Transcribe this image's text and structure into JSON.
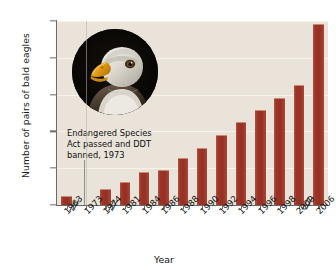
{
  "chart_data": {
    "type": "bar",
    "title": "",
    "xlabel": "Year",
    "ylabel": "Number of pairs of bald eagles",
    "categories": [
      "1963",
      "1973",
      "1974",
      "1981",
      "1984",
      "1986",
      "1988",
      "1990",
      "1992",
      "1994",
      "1996",
      "1998",
      "2000",
      "2006"
    ],
    "tick_labels": [
      "1963",
      "1973",
      "1974",
      "1981",
      "1984",
      "1986",
      "1988",
      "1990",
      "1992",
      "1994",
      "1996",
      "1998",
      "2000",
      "2006"
    ],
    "values": [
      417,
      null,
      791,
      1188,
      1757,
      1875,
      2475,
      3035,
      3749,
      4449,
      5094,
      5748,
      6471,
      9789
    ],
    "ylim": [
      0,
      10000
    ],
    "ytick_labels": [
      "0",
      "2000",
      "4000",
      "6000",
      "8000",
      "10,000"
    ],
    "ytick_values": [
      0,
      2000,
      4000,
      6000,
      8000,
      10000
    ],
    "grid": true,
    "legend": "none",
    "axis_breaks": [
      "after 1963",
      "after 1974",
      "after 2000"
    ],
    "bar_color": "#9c3527",
    "plot_background": "#e9e3d9",
    "annotation": {
      "line1": "Endangered Species",
      "line2": "Act passed and DDT",
      "line3": "banned, 1973"
    }
  },
  "figure": {
    "photo_caption": "bald-eagle-head-photo"
  }
}
